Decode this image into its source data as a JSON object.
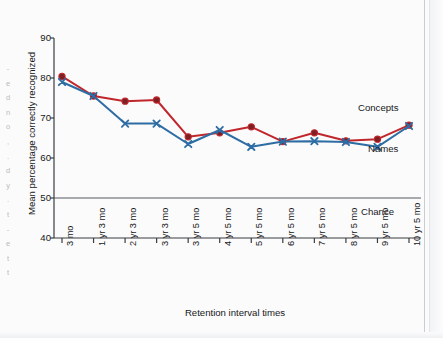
{
  "figure": {
    "margin_text_fragments": [
      "-",
      "e",
      "d",
      "n",
      "o",
      ",",
      ".",
      "d",
      "y",
      ".",
      "t",
      "-",
      "e",
      "t",
      "t"
    ]
  },
  "chart_data": {
    "type": "line",
    "title": "",
    "xlabel": "Retention interval times",
    "ylabel": "Mean percentage correctly recognized",
    "categories": [
      "3 mo",
      "1 yr 3 mo",
      "2 yr 3 mo",
      "3 yr 3 mo",
      "3 yr 5 mo",
      "4 yr 5 mo",
      "5 yr 5 mo",
      "6 yr 5 mo",
      "7 yr 5 mo",
      "8 yr 5 mo",
      "9 yr 5 mo",
      "10 yr 5 mo"
    ],
    "ylim": [
      40,
      90
    ],
    "yticks": [
      40,
      50,
      60,
      70,
      80,
      90
    ],
    "ytick_labels": [
      "40",
      "50",
      "60",
      "70",
      "80",
      "90"
    ],
    "grid": false,
    "legend_position": "inline-right",
    "series": [
      {
        "name": "Concepts",
        "color": "#c0272d",
        "marker": "circle",
        "values": [
          80.4,
          75.5,
          74.2,
          74.5,
          65.3,
          66.3,
          67.8,
          64.1,
          66.3,
          64.3,
          64.7,
          68.2
        ]
      },
      {
        "name": "Names",
        "color": "#2e6da4",
        "marker": "x",
        "values": [
          79.0,
          75.5,
          68.6,
          68.6,
          63.5,
          67.0,
          62.8,
          64.1,
          64.2,
          64.0,
          62.8,
          68.0
        ]
      }
    ],
    "reference_line": {
      "label": "Chance",
      "value": 50,
      "color": "#555a5f"
    }
  }
}
